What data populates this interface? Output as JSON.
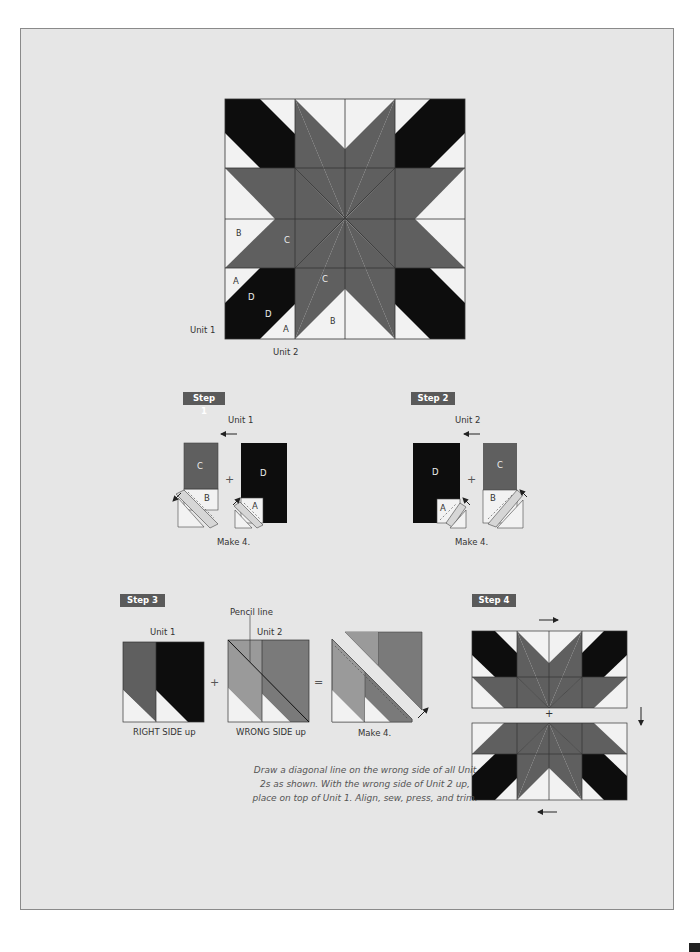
{
  "main_block": {
    "labels": {
      "unit1": "Unit 1",
      "unit2": "Unit 2",
      "piece_b_left": "B",
      "piece_c_left": "C",
      "piece_c_center": "C",
      "piece_a_top": "A",
      "piece_d_top": "D",
      "piece_d_bottom": "D",
      "piece_a_bottom": "A",
      "piece_b_bottom": "B"
    }
  },
  "steps": [
    {
      "tag": "Step 1",
      "unit_label": "Unit 1",
      "pieces": {
        "c": "C",
        "b": "B",
        "d": "D",
        "a": "A"
      },
      "operator": "+",
      "make": "Make 4."
    },
    {
      "tag": "Step 2",
      "unit_label": "Unit 2",
      "pieces": {
        "d": "D",
        "a": "A",
        "c": "C",
        "b": "B"
      },
      "operator": "+",
      "make": "Make 4."
    },
    {
      "tag": "Step 3",
      "unit1_label": "Unit 1",
      "unit2_label": "Unit 2",
      "pencil_line_label": "Pencil line",
      "right_side_label": "RIGHT SIDE up",
      "wrong_side_label": "WRONG SIDE up",
      "plus": "+",
      "equals": "=",
      "make": "Make 4."
    },
    {
      "tag": "Step 4",
      "plus": "+"
    }
  ],
  "instructions": "Draw a diagonal line on the wrong side of all Unit 2s as shown. With the wrong side of Unit 2 up, place on top of Unit 1. Align, sew, press, and trim.",
  "colors": {
    "background": "#e6e6e6",
    "light": "#f2f2f2",
    "medium": "#5f5f5f",
    "dark": "#0d0d0d",
    "light_gray_wrong_side": "#9a9a9a",
    "step_tag": "#5a5a5a"
  }
}
